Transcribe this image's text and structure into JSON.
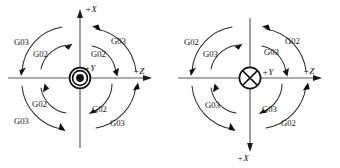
{
  "figure": {
    "background_color": "#ffffff",
    "line_color": "#2b2b2b",
    "axis_color": "#55585c",
    "text_color": "#151515"
  },
  "diagrams": [
    {
      "id": "left",
      "center_symbol": "dot-in-circle-icon",
      "center_symbol_meaning": "axis pointing out of page",
      "center_label": "+Y",
      "axes": [
        {
          "name": "vertical-up-axis",
          "label": "+X",
          "direction": "up"
        },
        {
          "name": "horizontal-right-axis",
          "label": "+Z",
          "direction": "right"
        }
      ],
      "quadrant_labels": [
        {
          "quadrant": "top-left",
          "outer": "G03",
          "inner": "G02"
        },
        {
          "quadrant": "top-right",
          "outer": "G03",
          "inner": "G02"
        },
        {
          "quadrant": "bottom-left",
          "outer": "G03",
          "inner": "G02"
        },
        {
          "quadrant": "bottom-right",
          "outer": "G03",
          "inner": "G02"
        }
      ]
    },
    {
      "id": "right",
      "center_symbol": "cross-in-circle-icon",
      "center_symbol_meaning": "axis pointing into page",
      "center_label": "+Y",
      "axes": [
        {
          "name": "vertical-down-axis",
          "label": "+X",
          "direction": "down"
        },
        {
          "name": "horizontal-right-axis",
          "label": "+Z",
          "direction": "right"
        }
      ],
      "quadrant_labels": [
        {
          "quadrant": "top-left",
          "outer": "G02",
          "inner": "G03"
        },
        {
          "quadrant": "top-right",
          "outer": "G02",
          "inner": "G03"
        },
        {
          "quadrant": "bottom-left",
          "outer": "G03",
          "inner": ""
        },
        {
          "quadrant": "bottom-right",
          "outer": "G02",
          "inner": "G03"
        }
      ]
    }
  ],
  "text": {
    "left": {
      "axis_x": "+X",
      "axis_z": "+Z",
      "center": "+Y",
      "tl_outer": "G03",
      "tl_inner": "G02",
      "tr_outer": "G03",
      "tr_inner": "G02",
      "bl_outer": "G03",
      "bl_inner": "G02",
      "br_outer": "G03",
      "br_inner": "G02"
    },
    "right": {
      "axis_x": "+X",
      "axis_z": "+Z",
      "center": "+Y",
      "tl_outer": "G02",
      "tl_inner": "G03",
      "tr_outer": "G02",
      "tr_inner": "G03",
      "bl_outer": "G03",
      "br_outer": "G02",
      "br_inner": "G03"
    }
  }
}
